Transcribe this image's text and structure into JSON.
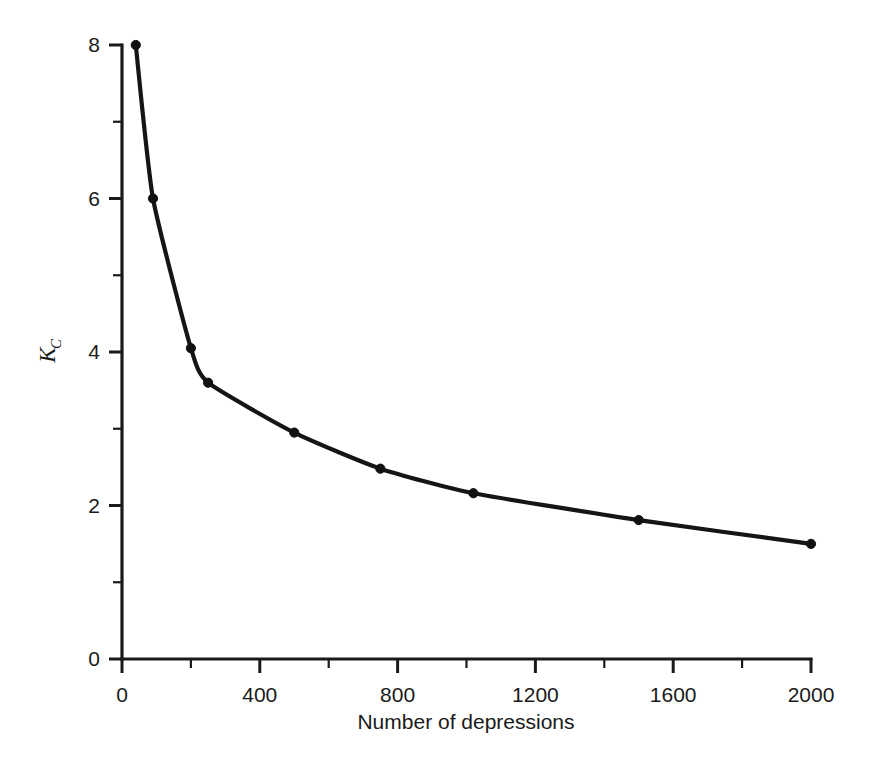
{
  "chart_data": {
    "type": "line",
    "title": "",
    "subtitle": "",
    "xlabel": "Number of depressions",
    "ylabel": "K_C",
    "ylabel_main": "K",
    "ylabel_subscript": "C",
    "xlim": [
      0,
      2000
    ],
    "ylim": [
      0,
      8
    ],
    "grid": false,
    "legend": null,
    "markers": "filled-circle",
    "line_color": "#151515",
    "marker_color": "#111111",
    "x_major_ticks": [
      0,
      400,
      800,
      1200,
      1600,
      2000
    ],
    "x_minor_ticks": [
      200,
      600,
      1000,
      1400,
      1800
    ],
    "x_tick_labels": [
      "0",
      "400",
      "800",
      "1200",
      "1600",
      "2000"
    ],
    "y_major_ticks": [
      0,
      2,
      4,
      6,
      8
    ],
    "y_minor_ticks": [
      1,
      3,
      5,
      7
    ],
    "y_tick_labels": [
      "0",
      "2",
      "4",
      "6",
      "8"
    ],
    "series": [
      {
        "name": "Kc vs number of depressions",
        "x": [
          40,
          90,
          200,
          250,
          500,
          750,
          1020,
          1500,
          2000
        ],
        "y": [
          8.0,
          6.0,
          4.05,
          3.6,
          2.95,
          2.48,
          2.16,
          1.81,
          1.5
        ]
      }
    ]
  }
}
